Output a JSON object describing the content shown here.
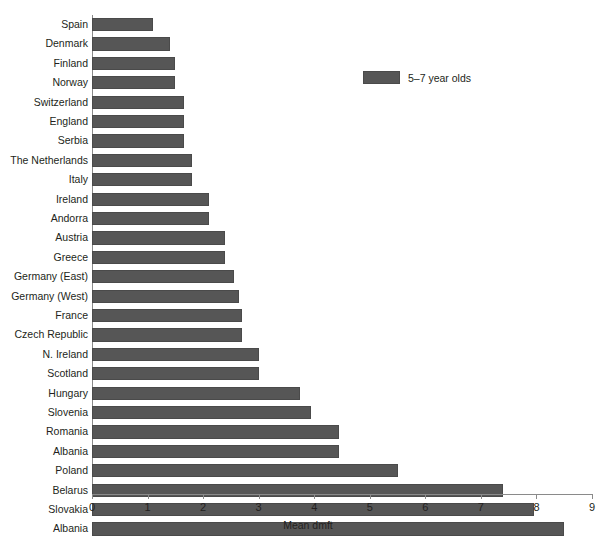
{
  "chart_data": {
    "type": "bar",
    "orientation": "horizontal",
    "title": "",
    "xlabel": "Mean dmft",
    "ylabel": "",
    "xlim": [
      0,
      9
    ],
    "xticks": [
      0,
      1,
      2,
      3,
      4,
      5,
      6,
      7,
      8,
      9
    ],
    "grid": false,
    "legend_position": "top-right",
    "series": [
      {
        "name": "5–7 year olds",
        "color": "#565656"
      }
    ],
    "categories": [
      "Spain",
      "Denmark",
      "Finland",
      "Norway",
      "Switzerland",
      "England",
      "Serbia",
      "The Netherlands",
      "Italy",
      "Ireland",
      "Andorra",
      "Austria",
      "Greece",
      "Germany (East)",
      "Germany (West)",
      "France",
      "Czech Republic",
      "N. Ireland",
      "Scotland",
      "Hungary",
      "Slovenia",
      "Romania",
      "Albania",
      "Poland",
      "Belarus",
      "Slovakia",
      "Albania"
    ],
    "values": [
      1.1,
      1.4,
      1.5,
      1.5,
      1.65,
      1.65,
      1.65,
      1.8,
      1.8,
      2.1,
      2.1,
      2.4,
      2.4,
      2.55,
      2.65,
      2.7,
      2.7,
      3.0,
      3.0,
      3.75,
      3.95,
      4.45,
      4.45,
      5.5,
      7.4,
      7.95,
      8.5
    ]
  },
  "legend": {
    "label": "5–7 year olds"
  },
  "axis": {
    "x_title": "Mean dmft"
  },
  "caption": {
    "text": ""
  },
  "colors": {
    "bar": "#565656",
    "axis": "#8a8a8a",
    "text": "#231f20"
  }
}
